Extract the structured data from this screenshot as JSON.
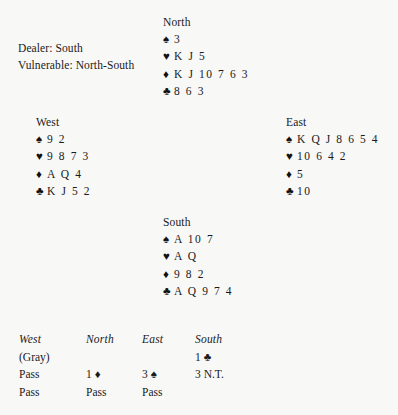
{
  "deal": {
    "dealer_text": "Dealer: South",
    "vulnerable_text": "Vulnerable: North-South",
    "suit_symbols": {
      "spade": "♠",
      "heart": "♥",
      "diamond": "♦",
      "club": "♣"
    },
    "hands": {
      "north": {
        "label": "North",
        "spades": "3",
        "hearts": "K J 5",
        "diamonds": "K J 10 7 6 3",
        "clubs": "8 6 3"
      },
      "west": {
        "label": "West",
        "spades": "9 2",
        "hearts": "9 8 7 3",
        "diamonds": "A Q 4",
        "clubs": "K J 5 2"
      },
      "east": {
        "label": "East",
        "spades": "K Q J 8 6 5 4",
        "hearts": "10 6 4 2",
        "diamonds": "5",
        "clubs": "10"
      },
      "south": {
        "label": "South",
        "spades": "A 10 7",
        "hearts": "A Q",
        "diamonds": "9 8 2",
        "clubs": "A Q 9 7 4"
      }
    }
  },
  "auction": {
    "headers": [
      "West",
      "North",
      "East",
      "South"
    ],
    "rows": [
      {
        "west": "(Gray)",
        "north": "",
        "east": "",
        "south": "1 ♣"
      },
      {
        "west": "Pass",
        "north": "1 ♦",
        "east": "3 ♠",
        "south": "3 N.T."
      },
      {
        "west": "Pass",
        "north": "Pass",
        "east": "Pass",
        "south": ""
      }
    ]
  }
}
